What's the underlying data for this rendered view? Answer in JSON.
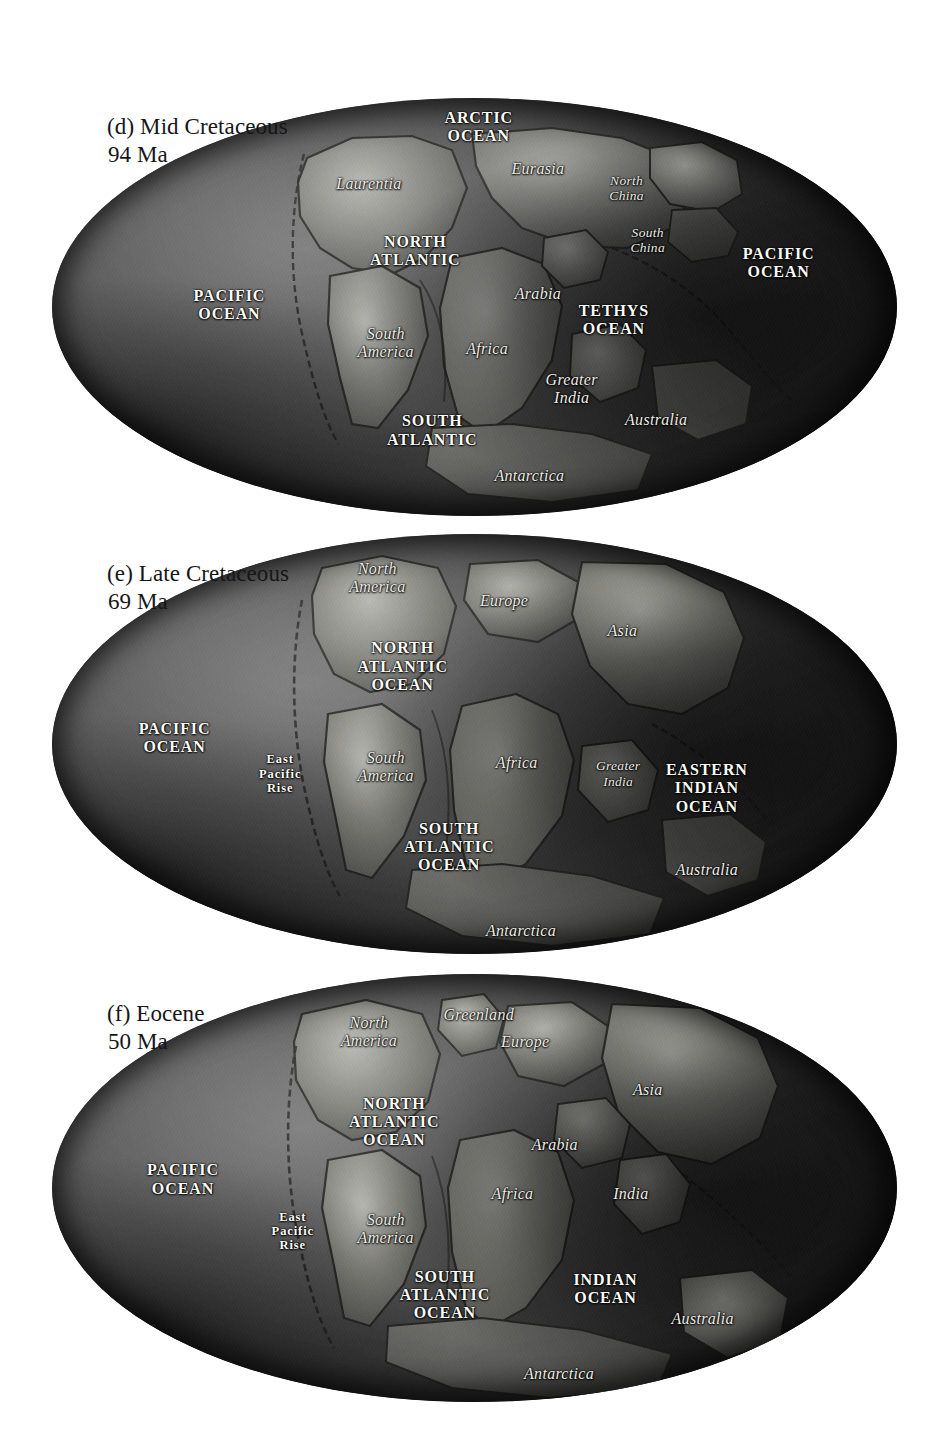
{
  "figure": {
    "background_color": "#ffffff",
    "ocean_color": "#4e4e4e",
    "land_color": "#8d8d8d",
    "label_color": "#f2f2ee",
    "caption_color": "#16161a"
  },
  "panels": [
    {
      "id": "panel-d",
      "letter": "(d)",
      "caption_line1": "(d) Mid Cretaceous",
      "caption_line2": "94 Ma",
      "epoch": "Mid Cretaceous",
      "age": "94 Ma",
      "labels": [
        {
          "text": "ARCTIC\nOCEAN",
          "kind": "ocean",
          "size": "normal",
          "x": 50.5,
          "y": 7.0
        },
        {
          "text": "Laurentia",
          "kind": "continent",
          "size": "normal",
          "x": 37.5,
          "y": 20.5
        },
        {
          "text": "Eurasia",
          "kind": "continent",
          "size": "normal",
          "x": 57.5,
          "y": 17.0
        },
        {
          "text": "North\nChina",
          "kind": "continent",
          "size": "small",
          "x": 68.0,
          "y": 21.5
        },
        {
          "text": "South\nChina",
          "kind": "continent",
          "size": "small",
          "x": 70.5,
          "y": 34.0
        },
        {
          "text": "NORTH\nATLANTIC",
          "kind": "ocean",
          "size": "normal",
          "x": 43.0,
          "y": 36.5
        },
        {
          "text": "PACIFIC\nOCEAN",
          "kind": "ocean",
          "size": "normal",
          "x": 86.0,
          "y": 39.5
        },
        {
          "text": "PACIFIC\nOCEAN",
          "kind": "ocean",
          "size": "normal",
          "x": 21.0,
          "y": 49.5
        },
        {
          "text": "Arabia",
          "kind": "continent",
          "size": "normal",
          "x": 57.5,
          "y": 47.0
        },
        {
          "text": "TETHYS\nOCEAN",
          "kind": "ocean",
          "size": "normal",
          "x": 66.5,
          "y": 53.0
        },
        {
          "text": "South\nAmerica",
          "kind": "continent",
          "size": "normal",
          "x": 39.5,
          "y": 58.5
        },
        {
          "text": "Africa",
          "kind": "continent",
          "size": "normal",
          "x": 51.5,
          "y": 60.0
        },
        {
          "text": "Greater\nIndia",
          "kind": "continent",
          "size": "normal",
          "x": 61.5,
          "y": 69.5
        },
        {
          "text": "Australia",
          "kind": "continent",
          "size": "normal",
          "x": 71.5,
          "y": 77.0
        },
        {
          "text": "SOUTH\nATLANTIC",
          "kind": "ocean",
          "size": "normal",
          "x": 45.0,
          "y": 79.5
        },
        {
          "text": "Antarctica",
          "kind": "continent",
          "size": "normal",
          "x": 56.5,
          "y": 90.5
        }
      ]
    },
    {
      "id": "panel-e",
      "letter": "(e)",
      "caption_line1": "(e) Late Cretaceous",
      "caption_line2": "69 Ma",
      "epoch": "Late Cretaceous",
      "age": "69 Ma",
      "labels": [
        {
          "text": "North\nAmerica",
          "kind": "continent",
          "size": "normal",
          "x": 38.5,
          "y": 10.5
        },
        {
          "text": "Europe",
          "kind": "continent",
          "size": "normal",
          "x": 53.5,
          "y": 16.0
        },
        {
          "text": "Asia",
          "kind": "continent",
          "size": "normal",
          "x": 67.5,
          "y": 23.0
        },
        {
          "text": "NORTH\nATLANTIC\nOCEAN",
          "kind": "ocean",
          "size": "normal",
          "x": 41.5,
          "y": 31.5
        },
        {
          "text": "PACIFIC\nOCEAN",
          "kind": "ocean",
          "size": "normal",
          "x": 14.5,
          "y": 48.5
        },
        {
          "text": "East\nPacific\nRise",
          "kind": "ocean",
          "size": "tiny",
          "x": 27.0,
          "y": 57.0
        },
        {
          "text": "South\nAmerica",
          "kind": "continent",
          "size": "normal",
          "x": 39.5,
          "y": 55.5
        },
        {
          "text": "Africa",
          "kind": "continent",
          "size": "normal",
          "x": 55.0,
          "y": 54.5
        },
        {
          "text": "Greater\nIndia",
          "kind": "continent",
          "size": "small",
          "x": 67.0,
          "y": 57.0
        },
        {
          "text": "EASTERN\nINDIAN\nOCEAN",
          "kind": "ocean",
          "size": "normal",
          "x": 77.5,
          "y": 60.5
        },
        {
          "text": "SOUTH\nATLANTIC\nOCEAN",
          "kind": "ocean",
          "size": "normal",
          "x": 47.0,
          "y": 74.5
        },
        {
          "text": "Australia",
          "kind": "continent",
          "size": "normal",
          "x": 77.5,
          "y": 80.0
        },
        {
          "text": "Antarctica",
          "kind": "continent",
          "size": "normal",
          "x": 55.5,
          "y": 94.5
        }
      ]
    },
    {
      "id": "panel-f",
      "letter": "(f)",
      "caption_line1": "(f) Eocene",
      "caption_line2": "50 Ma",
      "epoch": "Eocene",
      "age": "50 Ma",
      "labels": [
        {
          "text": "North\nAmerica",
          "kind": "continent",
          "size": "normal",
          "x": 37.5,
          "y": 13.5
        },
        {
          "text": "Greenland",
          "kind": "continent",
          "size": "normal",
          "x": 50.5,
          "y": 9.5
        },
        {
          "text": "Europe",
          "kind": "continent",
          "size": "normal",
          "x": 56.0,
          "y": 16.0
        },
        {
          "text": "Asia",
          "kind": "continent",
          "size": "normal",
          "x": 70.5,
          "y": 27.0
        },
        {
          "text": "NORTH\nATLANTIC\nOCEAN",
          "kind": "ocean",
          "size": "normal",
          "x": 40.5,
          "y": 34.5
        },
        {
          "text": "Arabia",
          "kind": "continent",
          "size": "normal",
          "x": 59.5,
          "y": 40.0
        },
        {
          "text": "PACIFIC\nOCEAN",
          "kind": "ocean",
          "size": "normal",
          "x": 15.5,
          "y": 48.0
        },
        {
          "text": "Africa",
          "kind": "continent",
          "size": "normal",
          "x": 54.5,
          "y": 51.5
        },
        {
          "text": "India",
          "kind": "continent",
          "size": "normal",
          "x": 68.5,
          "y": 51.5
        },
        {
          "text": "East\nPacific\nRise",
          "kind": "ocean",
          "size": "tiny",
          "x": 28.5,
          "y": 60.0
        },
        {
          "text": "South\nAmerica",
          "kind": "continent",
          "size": "normal",
          "x": 39.5,
          "y": 59.5
        },
        {
          "text": "SOUTH\nATLANTIC\nOCEAN",
          "kind": "ocean",
          "size": "normal",
          "x": 46.5,
          "y": 75.0
        },
        {
          "text": "INDIAN\nOCEAN",
          "kind": "ocean",
          "size": "normal",
          "x": 65.5,
          "y": 73.5
        },
        {
          "text": "Australia",
          "kind": "continent",
          "size": "normal",
          "x": 77.0,
          "y": 80.5
        },
        {
          "text": "Antarctica",
          "kind": "continent",
          "size": "normal",
          "x": 60.0,
          "y": 93.5
        }
      ]
    }
  ]
}
